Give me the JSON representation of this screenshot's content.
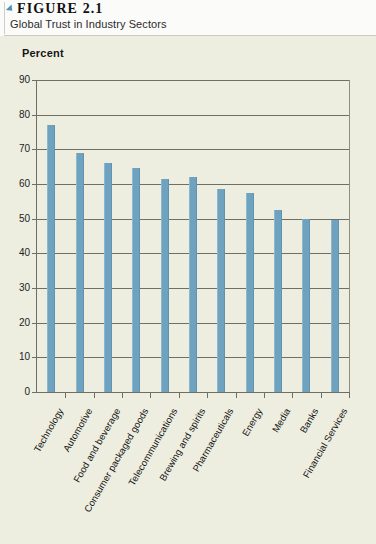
{
  "figure": {
    "marker_icon": "triangle-marker-icon",
    "label": "FIGURE 2.1",
    "caption": "Global Trust in Industry Sectors"
  },
  "colors": {
    "bar": "#6fa2bf",
    "marker": "#4f90b5",
    "plot_background": "#eeeee0",
    "header_background": "#fbfbfa",
    "gridline": "#6f6f64"
  },
  "chart_data": {
    "type": "bar",
    "title": "Global Trust in Industry Sectors",
    "xlabel": "",
    "ylabel": "Percent",
    "ylim": [
      0,
      90
    ],
    "yticks": [
      0,
      10,
      20,
      30,
      40,
      50,
      60,
      70,
      80,
      90
    ],
    "grid": true,
    "legend": "none",
    "categories": [
      "Technology",
      "Automotive",
      "Food and beverage",
      "Consumer packaged goods",
      "Telecommunications",
      "Brewing and spirits",
      "Pharmaceuticals",
      "Energy",
      "Media",
      "Banks",
      "Financial Services"
    ],
    "values": [
      77,
      69,
      66,
      64.5,
      61.5,
      62,
      58.5,
      57.5,
      52.5,
      50,
      49.5
    ]
  }
}
